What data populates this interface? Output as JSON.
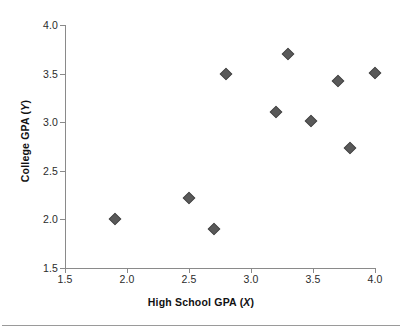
{
  "chart_data": {
    "type": "scatter",
    "title": "",
    "xlabel": "High School GPA (X)",
    "ylabel": "College GPA (Y)",
    "xlabel_text": "High School GPA",
    "xlabel_var": "X",
    "ylabel_text": "College GPA",
    "ylabel_var": "Y",
    "xlim": [
      1.5,
      4.0
    ],
    "ylim": [
      1.5,
      4.0
    ],
    "xticks": [
      "1.5",
      "2.0",
      "2.5",
      "3.0",
      "3.5",
      "4.0"
    ],
    "xtick_values": [
      1.5,
      2.0,
      2.5,
      3.0,
      3.5,
      4.0
    ],
    "yticks": [
      "1.5",
      "2.0",
      "2.5",
      "3.0",
      "3.5",
      "4.0"
    ],
    "ytick_values": [
      1.5,
      2.0,
      2.5,
      3.0,
      3.5,
      4.0
    ],
    "grid": false,
    "legend": false,
    "marker_shape": "diamond",
    "marker_color": "#595959",
    "axis_color": "#8a8a8a",
    "points": [
      {
        "x": 1.9,
        "y": 2.0
      },
      {
        "x": 2.5,
        "y": 2.22
      },
      {
        "x": 2.7,
        "y": 1.9
      },
      {
        "x": 2.8,
        "y": 3.5
      },
      {
        "x": 3.2,
        "y": 3.1
      },
      {
        "x": 3.3,
        "y": 3.7
      },
      {
        "x": 3.48,
        "y": 3.01
      },
      {
        "x": 3.7,
        "y": 3.42
      },
      {
        "x": 3.8,
        "y": 2.73
      },
      {
        "x": 4.0,
        "y": 3.51
      }
    ]
  }
}
